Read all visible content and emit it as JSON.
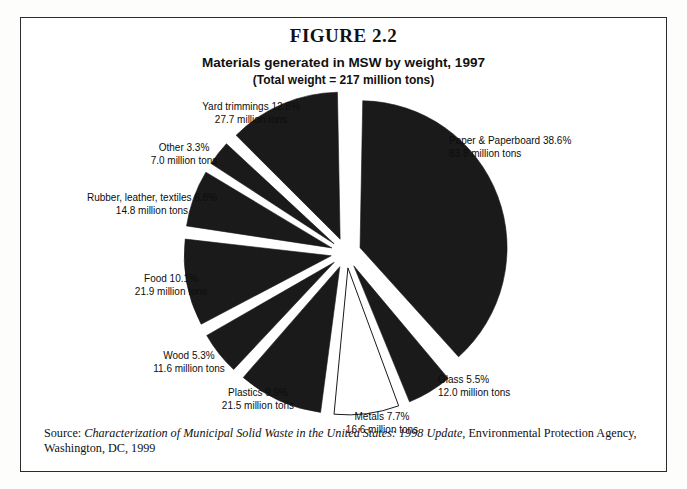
{
  "figure": {
    "number_label": "FIGURE 2.2",
    "title": "Materials generated in MSW by weight, 1997",
    "subtitle": "(Total  weight = 217 million tons)"
  },
  "source": {
    "prefix": "Source: ",
    "title": "Characterization of Municipal Solid Waste in the United States: 1998 Update",
    "rest": ", Environmental Protection Agency, Washington, DC, 1999"
  },
  "colors": {
    "slice_fill": "#1a1a1a",
    "slice_highlight_fill": "#ffffff",
    "slice_stroke": "#1a1a1a",
    "frame": "#2b2b2b",
    "text": "#111111",
    "background": "#ffffff"
  },
  "labels": {
    "paper": {
      "line1": "Paper & Paperboard 38.6%",
      "line2": "83.8 million tons"
    },
    "glass": {
      "line1": "Glass 5.5%",
      "line2": "12.0 million tons"
    },
    "metals": {
      "line1": "Metals 7.7%",
      "line2": "16.6 million tons"
    },
    "plastics": {
      "line1": "Plastics 9.9%",
      "line2": "21.5 million tons"
    },
    "wood": {
      "line1": "Wood 5.3%",
      "line2": "11.6 million tons"
    },
    "food": {
      "line1": "Food 10.1%",
      "line2": "21.9 million tons"
    },
    "rubber": {
      "line1": "Rubber, leather, textiles 6.8%",
      "line2": "14.8 million tons"
    },
    "other": {
      "line1": "Other 3.3%",
      "line2": "7.0 million tons"
    },
    "yard": {
      "line1": "Yard trimmings 12.8%",
      "line2": "27.7 million tons"
    }
  },
  "chart_data": {
    "type": "pie",
    "title": "Materials generated in MSW by weight, 1997",
    "subtitle": "(Total  weight = 217 million tons)",
    "units": "million tons",
    "total": 217,
    "exploded": true,
    "start_angle_deg": 0,
    "direction": "clockwise",
    "legend": "none (direct labels)",
    "categories": [
      "Paper & Paperboard",
      "Glass",
      "Metals",
      "Plastics",
      "Wood",
      "Food",
      "Rubber, leather, textiles",
      "Other",
      "Yard trimmings"
    ],
    "values_percent": [
      38.6,
      5.5,
      7.7,
      9.9,
      5.3,
      10.1,
      6.8,
      3.3,
      12.8
    ],
    "values_million_tons": [
      83.8,
      12.0,
      16.6,
      21.5,
      11.6,
      21.9,
      14.8,
      7.0,
      27.7
    ],
    "slices": [
      {
        "name": "Paper & Paperboard",
        "percent": 38.6,
        "tons": 83.8,
        "fill": "#1a1a1a",
        "highlight": false
      },
      {
        "name": "Glass",
        "percent": 5.5,
        "tons": 12.0,
        "fill": "#1a1a1a",
        "highlight": false
      },
      {
        "name": "Metals",
        "percent": 7.7,
        "tons": 16.6,
        "fill": "#ffffff",
        "highlight": true
      },
      {
        "name": "Plastics",
        "percent": 9.9,
        "tons": 21.5,
        "fill": "#1a1a1a",
        "highlight": false
      },
      {
        "name": "Wood",
        "percent": 5.3,
        "tons": 11.6,
        "fill": "#1a1a1a",
        "highlight": false
      },
      {
        "name": "Food",
        "percent": 10.1,
        "tons": 21.9,
        "fill": "#1a1a1a",
        "highlight": false
      },
      {
        "name": "Rubber, leather, textiles",
        "percent": 6.8,
        "tons": 14.8,
        "fill": "#1a1a1a",
        "highlight": false
      },
      {
        "name": "Other",
        "percent": 3.3,
        "tons": 7.0,
        "fill": "#1a1a1a",
        "highlight": false
      },
      {
        "name": "Yard trimmings",
        "percent": 12.8,
        "tons": 27.7,
        "fill": "#1a1a1a",
        "highlight": false
      }
    ]
  }
}
